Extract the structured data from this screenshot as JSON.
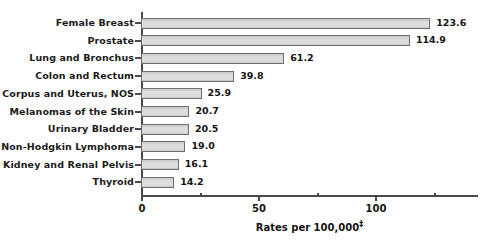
{
  "chart_data": {
    "type": "bar",
    "orientation": "horizontal",
    "title": "",
    "subtitle": "",
    "xlabel": "Rates per 100,000",
    "xlabel_footnote_mark": "‡",
    "ylabel": "",
    "categories": [
      "Female Breast",
      "Prostate",
      "Lung and Bronchus",
      "Colon and Rectum",
      "Corpus and Uterus, NOS",
      "Melanomas of the Skin",
      "Urinary Bladder",
      "Non-Hodgkin Lymphoma",
      "Kidney and Renal Pelvis",
      "Thyroid"
    ],
    "values": [
      123.6,
      114.9,
      61.2,
      39.8,
      25.9,
      20.7,
      20.5,
      19.0,
      16.1,
      14.2
    ],
    "value_labels": [
      "123.6",
      "114.9",
      "61.2",
      "39.8",
      "25.9",
      "20.7",
      "20.5",
      "19.0",
      "16.1",
      "14.2"
    ],
    "xlim": [
      0,
      144
    ],
    "x_major_ticks": [
      0,
      50,
      100
    ],
    "x_major_tick_labels": [
      "0",
      "50",
      "100"
    ],
    "x_minor_ticks": [
      25,
      75,
      125
    ],
    "grid": false,
    "legend": null,
    "bar_fill_color": "#d9d9d9",
    "bar_border_color": "#6e6e6e",
    "axis_color": "#4a4a4a",
    "text_color": "#141414",
    "background_color": "#ffffff"
  }
}
